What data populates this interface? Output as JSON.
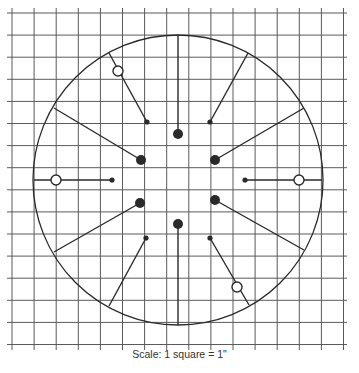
{
  "caption": "Scale: 1 square = 1\"",
  "colors": {
    "background": "#ffffff",
    "grid": "#5a5a5a",
    "ink": "#2a2a2a"
  },
  "grid": {
    "origin_x": 12,
    "origin_y": 13,
    "spacing": 22.1,
    "columns": 16,
    "rows": 16,
    "x_start": 7,
    "x_end": 347,
    "y_start": 8,
    "y_end": 350
  },
  "circle": {
    "cx": 178,
    "cy": 180,
    "r": 145
  },
  "spokes": [
    {
      "name": "spoke-top",
      "x1": 178,
      "y1": 35,
      "x2": 178,
      "y2": 134,
      "end": "large-dot"
    },
    {
      "name": "spoke-bottom",
      "x1": 178,
      "y1": 325,
      "x2": 178,
      "y2": 224,
      "end": "large-dot"
    },
    {
      "name": "spoke-upper-left",
      "x1": 54,
      "y1": 108,
      "x2": 141,
      "y2": 160,
      "end": "large-dot"
    },
    {
      "name": "spoke-upper-right",
      "x1": 304,
      "y1": 108,
      "x2": 215,
      "y2": 160,
      "end": "large-dot"
    },
    {
      "name": "spoke-lower-left",
      "x1": 54,
      "y1": 252,
      "x2": 140,
      "y2": 203,
      "end": "large-dot"
    },
    {
      "name": "spoke-lower-right",
      "x1": 304,
      "y1": 250,
      "x2": 215,
      "y2": 200,
      "end": "large-dot"
    },
    {
      "name": "spoke-left",
      "x1": 34,
      "y1": 180,
      "x2": 112,
      "y2": 180,
      "end": "small-dot"
    },
    {
      "name": "spoke-right",
      "x1": 322,
      "y1": 180,
      "x2": 245,
      "y2": 180,
      "end": "small-dot"
    },
    {
      "name": "spoke-upper-left-short",
      "x1": 109,
      "y1": 53,
      "x2": 147,
      "y2": 122,
      "end": "small-dot"
    },
    {
      "name": "spoke-upper-right-short",
      "x1": 248,
      "y1": 53,
      "x2": 210,
      "y2": 122,
      "end": "small-dot"
    },
    {
      "name": "spoke-lower-left-short",
      "x1": 109,
      "y1": 306,
      "x2": 146,
      "y2": 238,
      "end": "small-dot"
    },
    {
      "name": "spoke-lower-right-short",
      "x1": 249,
      "y1": 305,
      "x2": 210,
      "y2": 238,
      "end": "small-dot"
    }
  ],
  "open_circles": [
    {
      "name": "open-marker-left",
      "cx": 56,
      "cy": 180
    },
    {
      "name": "open-marker-right",
      "cx": 299,
      "cy": 180
    },
    {
      "name": "open-marker-upper-left",
      "cx": 118,
      "cy": 71
    },
    {
      "name": "open-marker-lower-right",
      "cx": 237,
      "cy": 287
    }
  ],
  "marker_sizes": {
    "large_dot_r": 5,
    "small_dot_r": 2.6,
    "open_circle_r": 5
  }
}
